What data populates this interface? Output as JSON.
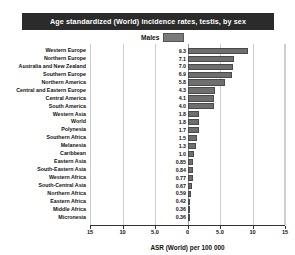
{
  "header": {
    "title": "Age standardized (World) incidence rates, testis, by sex"
  },
  "legend": {
    "entries": [
      {
        "label": "Males",
        "color": "#6e6e6e"
      }
    ]
  },
  "axis": {
    "title": "ASR (World) per 100 000",
    "ticks": [
      "15",
      "10",
      "5.0",
      "0",
      "5.0",
      "10",
      "15"
    ],
    "tick_values": [
      -15,
      -10,
      -5,
      0,
      5,
      10,
      15
    ]
  },
  "chart_data": {
    "type": "bar",
    "title": "Age standardized (World) incidence rates, testis, by sex",
    "subtitle": "",
    "xlabel": "ASR (World) per 100 000",
    "ylabel": "",
    "orientation": "horizontal",
    "xlim": [
      -15,
      15
    ],
    "xticks": [
      -15,
      -10,
      -5,
      0,
      5,
      10,
      15
    ],
    "xticklabels": [
      "15",
      "10",
      "5.0",
      "0",
      "5.0",
      "10",
      "15"
    ],
    "grid": true,
    "legend_position": "top-center",
    "categories": [
      "Western Europe",
      "Northern Europe",
      "Australia and New Zealand",
      "Southern Europe",
      "Northern America",
      "Central and Eastern Europe",
      "Central America",
      "South America",
      "Western Asia",
      "World",
      "Polynesia",
      "Southern Africa",
      "Melanesia",
      "Caribbean",
      "Eastern Asia",
      "South-Eastern Asia",
      "Western Africa",
      "South-Central Asia",
      "Northern Africa",
      "Eastern Africa",
      "Middle Africa",
      "Micronesia"
    ],
    "series": [
      {
        "name": "Males",
        "color": "#6e6e6e",
        "values": [
          9.3,
          7.1,
          7.0,
          6.9,
          5.8,
          4.3,
          4.1,
          4.0,
          1.8,
          1.8,
          1.7,
          1.5,
          1.3,
          1.0,
          0.85,
          0.84,
          0.77,
          0.67,
          0.59,
          0.42,
          0.36,
          0.36
        ],
        "labels": [
          "9.3",
          "7.1",
          "7.0",
          "6.9",
          "5.8",
          "4.3",
          "4.1",
          "4.0",
          "1.8",
          "1.8",
          "1.7",
          "1.5",
          "1.3",
          "1.0",
          "0.85",
          "0.84",
          "0.77",
          "0.67",
          "0.59",
          "0.42",
          "0.36",
          "0.36"
        ]
      }
    ]
  }
}
